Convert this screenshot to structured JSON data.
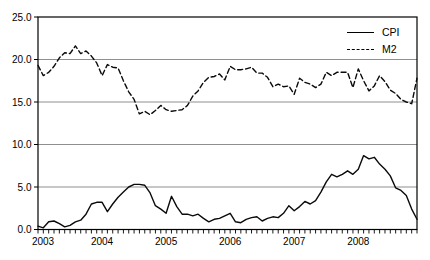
{
  "colors": {
    "background": "#ffffff",
    "gridline": "#8f8f8f",
    "axis": "#000000",
    "series": "#0a0a0a"
  },
  "legend": {
    "cpi_label": "CPI",
    "m2_label": "M2"
  },
  "chart_data": {
    "type": "line",
    "title": "",
    "xlabel": "",
    "ylabel": "",
    "grid": "horizontal",
    "legend_position": "top-right-inside",
    "ylim": [
      0,
      25
    ],
    "y_tick_labels": [
      "0.0",
      "5.0",
      "10.0",
      "15.0",
      "20.0",
      "25.0"
    ],
    "x_tick_labels": [
      "2003",
      "2004",
      "2005",
      "2006",
      "2007",
      "2008"
    ],
    "points_per_year": 12,
    "x_frequency": "monthly",
    "series": [
      {
        "name": "CPI",
        "style": "solid",
        "color": "#0a0a0a",
        "values": [
          0.4,
          0.2,
          0.9,
          1.0,
          0.7,
          0.3,
          0.5,
          0.9,
          1.1,
          1.8,
          3.0,
          3.2,
          3.2,
          2.1,
          3.0,
          3.8,
          4.4,
          5.0,
          5.3,
          5.3,
          5.2,
          4.3,
          2.8,
          2.4,
          1.9,
          3.9,
          2.7,
          1.8,
          1.8,
          1.6,
          1.8,
          1.3,
          0.9,
          1.2,
          1.3,
          1.6,
          1.9,
          0.9,
          0.8,
          1.2,
          1.4,
          1.5,
          1.0,
          1.3,
          1.5,
          1.4,
          1.9,
          2.8,
          2.2,
          2.7,
          3.3,
          3.0,
          3.4,
          4.4,
          5.6,
          6.5,
          6.2,
          6.5,
          6.9,
          6.5,
          7.1,
          8.7,
          8.3,
          8.5,
          7.7,
          7.1,
          6.3,
          4.9,
          4.6,
          4.0,
          2.4,
          1.2
        ]
      },
      {
        "name": "M2",
        "style": "dashed",
        "color": "#0a0a0a",
        "values": [
          19.3,
          18.1,
          18.5,
          19.2,
          20.2,
          20.8,
          20.7,
          21.6,
          20.7,
          21.0,
          20.4,
          19.6,
          18.1,
          19.4,
          19.1,
          19.0,
          17.5,
          16.2,
          15.3,
          13.6,
          13.9,
          13.5,
          14.0,
          14.6,
          14.1,
          13.9,
          14.0,
          14.1,
          14.6,
          15.7,
          16.3,
          17.3,
          17.9,
          18.0,
          18.3,
          17.6,
          19.2,
          18.8,
          18.8,
          18.9,
          19.1,
          18.4,
          18.4,
          17.9,
          16.8,
          17.1,
          16.8,
          16.9,
          15.9,
          17.8,
          17.3,
          17.1,
          16.7,
          17.1,
          18.5,
          18.1,
          18.5,
          18.5,
          18.5,
          16.7,
          18.9,
          17.5,
          16.3,
          16.9,
          18.1,
          17.4,
          16.4,
          16.0,
          15.3,
          15.0,
          14.8,
          17.8
        ]
      }
    ]
  }
}
